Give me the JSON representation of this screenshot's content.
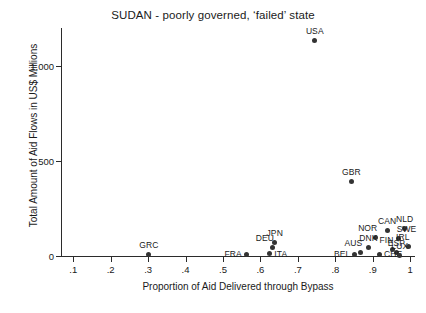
{
  "chart_data": {
    "type": "scatter",
    "title": "SUDAN - poorly governed, ‘failed’ state",
    "xlabel": "Proportion of Aid Delivered through Bypass",
    "ylabel": "Total Amount of Aid Flows in US$ Millions",
    "xlim": [
      0.07,
      1.01
    ],
    "ylim": [
      0,
      1200
    ],
    "grid": false,
    "legend": "none",
    "xticks": [
      {
        "value": 0.1,
        "label": ".1"
      },
      {
        "value": 0.2,
        "label": ".2"
      },
      {
        "value": 0.3,
        "label": ".3"
      },
      {
        "value": 0.4,
        "label": ".4"
      },
      {
        "value": 0.5,
        "label": ".5"
      },
      {
        "value": 0.6,
        "label": ".6"
      },
      {
        "value": 0.7,
        "label": ".7"
      },
      {
        "value": 0.8,
        "label": ".8"
      },
      {
        "value": 0.9,
        "label": ".9"
      },
      {
        "value": 1.0,
        "label": "1"
      }
    ],
    "yticks": [
      {
        "value": 0,
        "label": "0"
      },
      {
        "value": 500,
        "label": "500"
      },
      {
        "value": 1000,
        "label": "1,000"
      }
    ],
    "points": [
      {
        "label": "USA",
        "x": 0.745,
        "y": 1135,
        "labelpos": "above"
      },
      {
        "label": "GBR",
        "x": 0.843,
        "y": 390,
        "labelpos": "above"
      },
      {
        "label": "NLD",
        "x": 0.985,
        "y": 145,
        "labelpos": "above"
      },
      {
        "label": "CAN",
        "x": 0.938,
        "y": 135,
        "labelpos": "above"
      },
      {
        "label": "SWE",
        "x": 0.968,
        "y": 92,
        "labelpos": "aboveright"
      },
      {
        "label": "NOR",
        "x": 0.908,
        "y": 95,
        "labelpos": "aboveleft"
      },
      {
        "label": "JPN",
        "x": 0.638,
        "y": 70,
        "labelpos": "above"
      },
      {
        "label": "DEU",
        "x": 0.632,
        "y": 45,
        "labelpos": "aboveleft"
      },
      {
        "label": "IRL",
        "x": 0.995,
        "y": 48,
        "labelpos": "aboveleft"
      },
      {
        "label": "DNK",
        "x": 0.888,
        "y": 45,
        "labelpos": "above"
      },
      {
        "label": "FIN",
        "x": 0.952,
        "y": 35,
        "labelpos": "aboveleft"
      },
      {
        "label": "AUS",
        "x": 0.868,
        "y": 18,
        "labelpos": "aboveleft"
      },
      {
        "label": "ESP",
        "x": 0.963,
        "y": 18,
        "labelpos": "above"
      },
      {
        "label": "ITA",
        "x": 0.625,
        "y": 12,
        "labelpos": "right"
      },
      {
        "label": "CHE",
        "x": 0.918,
        "y": 8,
        "labelpos": "right"
      },
      {
        "label": "LUX",
        "x": 0.972,
        "y": 5,
        "labelpos": "above"
      },
      {
        "label": "BEL",
        "x": 0.852,
        "y": 8,
        "labelpos": "left"
      },
      {
        "label": "FRA",
        "x": 0.562,
        "y": 8,
        "labelpos": "left"
      },
      {
        "label": "GRC",
        "x": 0.302,
        "y": 10,
        "labelpos": "above"
      }
    ],
    "colors": {
      "marker": "#333333",
      "axis": "#2b2b2b",
      "text": "#1a1a1a",
      "background": "#ffffff"
    }
  }
}
